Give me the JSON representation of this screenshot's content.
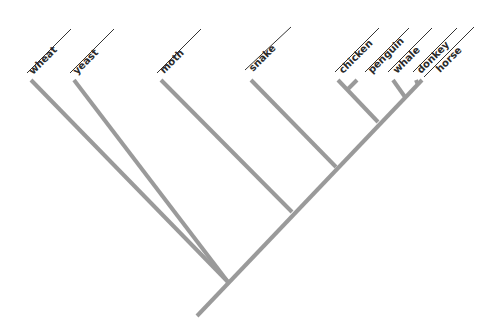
{
  "diagram": {
    "type": "cladogram",
    "colors": {
      "branch": "#9a9a9a",
      "text": "#2a2a2a",
      "label_line": "#333333"
    },
    "taxa": [
      {
        "id": "wheat",
        "label": "wheat"
      },
      {
        "id": "yeast",
        "label": "yeast"
      },
      {
        "id": "moth",
        "label": "moth"
      },
      {
        "id": "snake",
        "label": "snake"
      },
      {
        "id": "chicken",
        "label": "chicken"
      },
      {
        "id": "penguin",
        "label": "penguin"
      },
      {
        "id": "whale",
        "label": "whale"
      },
      {
        "id": "donkey",
        "label": "donkey"
      },
      {
        "id": "horse",
        "label": "horse"
      }
    ],
    "topology": "(((wheat, yeast), (moth, (snake, ((chicken, penguin), (whale, (donkey, horse)))))))"
  }
}
